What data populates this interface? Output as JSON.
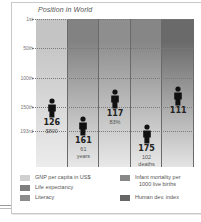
{
  "chart_data": {
    "type": "bar",
    "title": "Position in World",
    "xlabel": "",
    "ylabel": "Position in World",
    "y_ticks": [
      "1st",
      "50th",
      "100th",
      "150th",
      "193rd"
    ],
    "ylim": [
      1,
      193
    ],
    "y_inverted": true,
    "grid": true,
    "legend_position": "bottom",
    "categories": [
      "GNP per capita in US$",
      "Life expectancy",
      "Literacy",
      "Infant mortality per 1000 live births",
      "Human dev. index"
    ],
    "series": [
      {
        "name": "World rank",
        "values": [
          126,
          161,
          117,
          175,
          111
        ],
        "annotations": [
          "$800",
          "61 years",
          "83%",
          "102 deaths",
          ""
        ]
      }
    ],
    "colors": [
      "#c4c4c4",
      "#8a8a8a",
      "#9a9a9a",
      "#8e8e8e",
      "#6e6e6e"
    ]
  },
  "chart": {
    "title": "Position in World",
    "y_ticks": [
      {
        "label": "1st",
        "top": 19
      },
      {
        "label": "50th",
        "top": 48
      },
      {
        "label": "100th",
        "top": 78
      },
      {
        "label": "150th",
        "top": 107
      },
      {
        "label": "193rd",
        "top": 131
      }
    ],
    "columns": [
      {
        "rank": "126",
        "sub1": "$800",
        "sub2": "",
        "top_color": "#c4c4c4",
        "bottom_color": "#ececec",
        "fig_top": 98
      },
      {
        "rank": "161",
        "sub1": "61",
        "sub2": "years",
        "top_color": "#828282",
        "bottom_color": "#e8e8e8",
        "fig_top": 116
      },
      {
        "rank": "117",
        "sub1": "83%",
        "sub2": "",
        "top_color": "#8e8e8e",
        "bottom_color": "#e8e8e8",
        "fig_top": 89
      },
      {
        "rank": "175",
        "sub1": "102",
        "sub2": "deaths",
        "top_color": "#868686",
        "bottom_color": "#e8e8e8",
        "fig_top": 124
      },
      {
        "rank": "111",
        "sub1": "",
        "sub2": "",
        "top_color": "#6a6a6a",
        "bottom_color": "#e4e4e4",
        "fig_top": 86
      }
    ]
  },
  "legend": {
    "items": [
      {
        "label": "GNP per capita in US$",
        "color": "#d0d0d0"
      },
      {
        "label": "Life expectancy",
        "color": "#7e7e7e"
      },
      {
        "label": "Literacy",
        "color": "#8c8c8c"
      },
      {
        "label": "Infant mortality per",
        "label2": "1000 live births",
        "color": "#888888"
      },
      {
        "label": "Human dev. index",
        "color": "#666666"
      }
    ]
  }
}
